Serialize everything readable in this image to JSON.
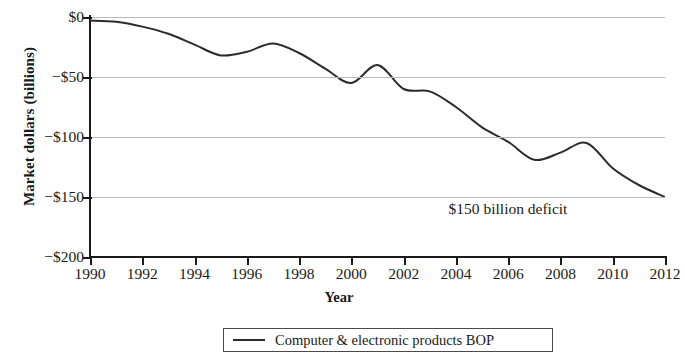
{
  "chart_data": {
    "type": "line",
    "title": "",
    "xlabel": "Year",
    "ylabel": "Market dollars (billions)",
    "xlim": [
      1990,
      2012
    ],
    "ylim": [
      -200,
      0
    ],
    "grid": true,
    "legend_position": "bottom",
    "y_tick_labels": [
      "$0",
      "−$50",
      "−$100",
      "−$150",
      "−$200"
    ],
    "y_ticks": [
      0,
      -50,
      -100,
      -150,
      -200
    ],
    "x_tick_labels": [
      "1990",
      "1992",
      "1994",
      "1996",
      "1998",
      "2000",
      "2002",
      "2004",
      "2006",
      "2008",
      "2010",
      "2012"
    ],
    "x_ticks": [
      1990,
      1992,
      1994,
      1996,
      1998,
      2000,
      2002,
      2004,
      2006,
      2008,
      2010,
      2012
    ],
    "annotations": [
      {
        "text": "$150 billion deficit",
        "x": 2009,
        "y": -153
      }
    ],
    "series": [
      {
        "name": "Computer & electronic products BOP",
        "color": "#2b2b2b",
        "x": [
          1990,
          1991,
          1992,
          1993,
          1994,
          1995,
          1996,
          1997,
          1998,
          1999,
          2000,
          2001,
          2002,
          2003,
          2004,
          2005,
          2006,
          2007,
          2008,
          2009,
          2010,
          2011,
          2012
        ],
        "values": [
          -3,
          -4,
          -8,
          -14,
          -23,
          -32,
          -29,
          -22,
          -30,
          -43,
          -55,
          -40,
          -60,
          -62,
          -75,
          -92,
          -104,
          -119,
          -113,
          -105,
          -126,
          -140,
          -150
        ]
      }
    ]
  },
  "legend": {
    "items": [
      {
        "label": "Computer & electronic products BOP"
      }
    ]
  }
}
